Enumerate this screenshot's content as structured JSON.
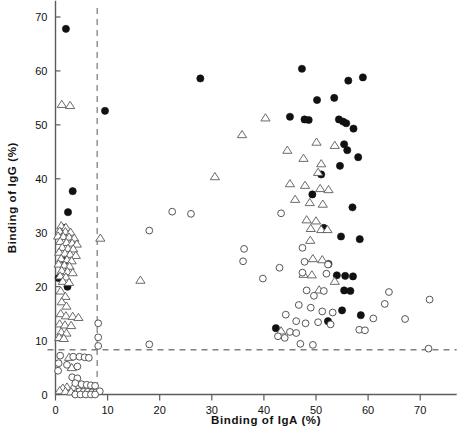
{
  "chart_data": {
    "type": "scatter",
    "title": "",
    "xlabel": "Binding of IgA (%)",
    "ylabel": "Binding of IgG (%)",
    "xlim": [
      -1.5,
      77
    ],
    "ylim": [
      -2,
      73
    ],
    "xticks": [
      0,
      10,
      20,
      30,
      40,
      50,
      60,
      70
    ],
    "xticklabels": [
      "0",
      "10",
      "20",
      "30",
      "40",
      "50",
      "60",
      "70"
    ],
    "yticks": [
      0,
      10,
      20,
      30,
      40,
      50,
      60,
      70
    ],
    "yticklabels": [
      "0",
      "10",
      "20",
      "30",
      "40",
      "50",
      "60",
      "70"
    ],
    "grid": false,
    "legend_position": "none",
    "reference_lines": [
      {
        "name": "iga-cutoff",
        "orientation": "vertical",
        "value": 8,
        "style": "dashed",
        "color": "#808086"
      },
      {
        "name": "igg-cutoff",
        "orientation": "horizontal",
        "value": 8.3,
        "style": "dashed",
        "color": "#808086"
      }
    ],
    "marker_styles": {
      "filled_circle": {
        "fill": "#111111",
        "edge": "#111111",
        "size": 4.2
      },
      "open_circle": {
        "fill": "#ffffff",
        "edge": "#555555",
        "size": 4.0
      },
      "open_triangle": {
        "fill": "#ffffff",
        "edge": "#5a5a5a",
        "size": 4.4
      }
    },
    "series": [
      {
        "name": "filled-circle",
        "marker": "filled_circle",
        "points": [
          [
            2.0,
            67.8
          ],
          [
            9.5,
            52.6
          ],
          [
            27.8,
            58.6
          ],
          [
            3.3,
            37.7
          ],
          [
            2.4,
            33.8
          ],
          [
            1.6,
            30.9
          ],
          [
            1.8,
            24.8
          ],
          [
            0.6,
            21.6
          ],
          [
            2.3,
            20.0
          ],
          [
            42.3,
            12.3
          ],
          [
            47.3,
            60.4
          ],
          [
            53.5,
            55.0
          ],
          [
            56.2,
            58.2
          ],
          [
            59.0,
            58.8
          ],
          [
            50.2,
            54.6
          ],
          [
            45.0,
            51.5
          ],
          [
            47.8,
            51.0
          ],
          [
            48.6,
            50.9
          ],
          [
            54.4,
            51.0
          ],
          [
            55.2,
            50.6
          ],
          [
            55.8,
            50.3
          ],
          [
            57.2,
            49.3
          ],
          [
            55.4,
            46.4
          ],
          [
            56.0,
            45.3
          ],
          [
            58.1,
            44.0
          ],
          [
            54.6,
            42.4
          ],
          [
            51.0,
            40.8
          ],
          [
            49.3,
            37.1
          ],
          [
            57.0,
            34.7
          ],
          [
            51.5,
            30.9
          ],
          [
            54.8,
            29.3
          ],
          [
            58.4,
            28.8
          ],
          [
            52.4,
            24.2
          ],
          [
            54.0,
            22.1
          ],
          [
            55.6,
            22.0
          ],
          [
            57.1,
            21.9
          ],
          [
            55.4,
            19.3
          ],
          [
            56.6,
            19.2
          ],
          [
            55.0,
            15.6
          ],
          [
            58.6,
            14.7
          ],
          [
            52.3,
            13.6
          ]
        ]
      },
      {
        "name": "open-triangle",
        "marker": "open_triangle",
        "points": [
          [
            1.2,
            53.8
          ],
          [
            2.8,
            53.6
          ],
          [
            40.3,
            51.3
          ],
          [
            35.8,
            48.2
          ],
          [
            44.5,
            45.3
          ],
          [
            50.1,
            46.8
          ],
          [
            53.6,
            46.2
          ],
          [
            47.6,
            43.8
          ],
          [
            51.0,
            42.8
          ],
          [
            50.4,
            41.2
          ],
          [
            30.6,
            40.4
          ],
          [
            45.0,
            39.1
          ],
          [
            47.9,
            38.8
          ],
          [
            50.8,
            38.2
          ],
          [
            52.4,
            38.0
          ],
          [
            46.0,
            36.2
          ],
          [
            48.8,
            35.6
          ],
          [
            51.3,
            35.3
          ],
          [
            48.2,
            32.4
          ],
          [
            50.0,
            32.2
          ],
          [
            49.0,
            30.8
          ],
          [
            51.0,
            30.6
          ],
          [
            52.2,
            30.6
          ],
          [
            8.6,
            29.0
          ],
          [
            1.1,
            31.3
          ],
          [
            2.0,
            31.0
          ],
          [
            0.8,
            30.3
          ],
          [
            1.9,
            30.2
          ],
          [
            2.9,
            30.1
          ],
          [
            0.5,
            29.4
          ],
          [
            1.5,
            29.3
          ],
          [
            2.6,
            29.2
          ],
          [
            3.6,
            29.0
          ],
          [
            0.9,
            28.4
          ],
          [
            2.1,
            28.2
          ],
          [
            3.2,
            28.1
          ],
          [
            4.1,
            27.9
          ],
          [
            1.3,
            27.3
          ],
          [
            2.4,
            27.1
          ],
          [
            3.4,
            27.0
          ],
          [
            0.7,
            26.4
          ],
          [
            1.8,
            26.2
          ],
          [
            2.8,
            26.0
          ],
          [
            3.9,
            25.8
          ],
          [
            1.1,
            25.2
          ],
          [
            2.2,
            25.0
          ],
          [
            3.1,
            24.8
          ],
          [
            0.6,
            24.2
          ],
          [
            1.7,
            24.0
          ],
          [
            2.7,
            23.8
          ],
          [
            1.2,
            23.0
          ],
          [
            2.3,
            22.8
          ],
          [
            3.3,
            22.6
          ],
          [
            0.9,
            22.0
          ],
          [
            2.0,
            21.8
          ],
          [
            1.4,
            21.0
          ],
          [
            2.6,
            20.8
          ],
          [
            16.3,
            21.2
          ],
          [
            1.0,
            19.2
          ],
          [
            1.9,
            18.2
          ],
          [
            1.2,
            17.2
          ],
          [
            2.1,
            16.4
          ],
          [
            1.0,
            15.0
          ],
          [
            2.0,
            14.6
          ],
          [
            3.3,
            14.5
          ],
          [
            4.4,
            14.3
          ],
          [
            0.8,
            13.1
          ],
          [
            1.8,
            12.9
          ],
          [
            3.0,
            12.8
          ],
          [
            1.1,
            11.6
          ],
          [
            2.1,
            11.4
          ],
          [
            0.7,
            10.6
          ],
          [
            1.6,
            10.4
          ],
          [
            43.3,
            11.8
          ],
          [
            48.9,
            28.6
          ],
          [
            49.4,
            25.2
          ],
          [
            51.2,
            25.0
          ],
          [
            47.6,
            22.3
          ],
          [
            49.2,
            22.2
          ],
          [
            53.6,
            21.0
          ],
          [
            50.6,
            19.4
          ],
          [
            2.6,
            6.9
          ],
          [
            3.1,
            5.0
          ],
          [
            2.2,
            1.4
          ],
          [
            3.4,
            1.3
          ],
          [
            1.4,
            1.2
          ],
          [
            0.8,
            0.7
          ],
          [
            1.9,
            0.6
          ],
          [
            3.0,
            0.5
          ],
          [
            4.0,
            0.5
          ],
          [
            5.0,
            0.4
          ]
        ]
      },
      {
        "name": "open-circle",
        "marker": "open_circle",
        "points": [
          [
            22.4,
            33.9
          ],
          [
            26.0,
            33.5
          ],
          [
            18.0,
            30.4
          ],
          [
            43.3,
            33.6
          ],
          [
            36.2,
            27.0
          ],
          [
            47.4,
            27.2
          ],
          [
            36.0,
            24.7
          ],
          [
            47.8,
            24.6
          ],
          [
            52.3,
            24.1
          ],
          [
            43.0,
            23.5
          ],
          [
            47.4,
            22.6
          ],
          [
            52.0,
            22.4
          ],
          [
            39.8,
            21.5
          ],
          [
            71.8,
            17.6
          ],
          [
            64.0,
            19.0
          ],
          [
            63.2,
            16.8
          ],
          [
            67.1,
            14.0
          ],
          [
            61.0,
            14.1
          ],
          [
            8.2,
            13.2
          ],
          [
            8.2,
            10.6
          ],
          [
            48.2,
            19.3
          ],
          [
            49.6,
            18.3
          ],
          [
            51.5,
            19.2
          ],
          [
            46.7,
            16.6
          ],
          [
            49.0,
            16.1
          ],
          [
            51.2,
            15.4
          ],
          [
            53.2,
            15.2
          ],
          [
            44.2,
            14.8
          ],
          [
            46.2,
            13.6
          ],
          [
            48.0,
            13.2
          ],
          [
            50.4,
            13.4
          ],
          [
            52.8,
            13.0
          ],
          [
            45.0,
            11.6
          ],
          [
            46.2,
            11.4
          ],
          [
            58.3,
            12.0
          ],
          [
            59.4,
            11.9
          ],
          [
            42.7,
            10.8
          ],
          [
            44.0,
            10.5
          ],
          [
            18.0,
            9.3
          ],
          [
            8.2,
            9.0
          ],
          [
            47.0,
            9.4
          ],
          [
            49.4,
            9.2
          ],
          [
            71.6,
            8.5
          ],
          [
            0.9,
            7.2
          ],
          [
            3.4,
            7.0
          ],
          [
            4.6,
            7.0
          ],
          [
            5.6,
            6.9
          ],
          [
            6.4,
            6.8
          ],
          [
            0.6,
            5.8
          ],
          [
            2.2,
            5.5
          ],
          [
            4.2,
            5.2
          ],
          [
            0.5,
            4.4
          ],
          [
            3.2,
            3.2
          ],
          [
            4.2,
            3.0
          ],
          [
            3.8,
            2.1
          ],
          [
            5.0,
            1.9
          ],
          [
            6.0,
            1.8
          ],
          [
            6.8,
            1.7
          ],
          [
            7.6,
            1.6
          ],
          [
            4.6,
            0.6
          ],
          [
            5.4,
            0.5
          ],
          [
            6.2,
            0.5
          ],
          [
            7.0,
            0.4
          ],
          [
            7.8,
            0.4
          ],
          [
            8.5,
            0.6
          ],
          [
            3.8,
            0.0
          ],
          [
            4.8,
            0.0
          ],
          [
            5.8,
            0.0
          ],
          [
            6.8,
            0.0
          ],
          [
            7.6,
            0.0
          ]
        ]
      }
    ]
  },
  "axes": {
    "x_title": "Binding of IgA (%)",
    "y_title": "Binding of IgG (%)"
  }
}
